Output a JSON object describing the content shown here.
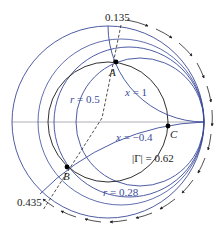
{
  "diagram": {
    "type": "smith-chart",
    "colors": {
      "blue": "#3a4a9a",
      "black": "#1a1a1a",
      "axis": "#9a9aa6"
    },
    "labels": {
      "wtg_top": "0.135",
      "wtg_bottom": "0.435",
      "point_a": "A",
      "point_b": "B",
      "point_c": "C",
      "r_half_var": "r",
      "r_half_val": " = 0.5",
      "x_one_var": "x",
      "x_one_val": " = 1",
      "x_neg_var": "x",
      "x_neg_val": " = −0.4",
      "gamma_val": "|Γ| = 0.62",
      "r_small_var": "r",
      "r_small_val": " = 0.28"
    },
    "points": [
      {
        "name": "A",
        "x": 116,
        "y": 62
      },
      {
        "name": "B",
        "x": 67,
        "y": 167
      },
      {
        "name": "C",
        "x": 168,
        "y": 126
      }
    ],
    "circles": {
      "unit": {
        "cx": 108,
        "cy": 122,
        "r": 96
      },
      "gamma": {
        "cx": 108,
        "cy": 122,
        "r": 60,
        "value": 0.62
      },
      "r_0_28": {
        "cx": 129,
        "cy": 122,
        "r": 75,
        "value": 0.28
      },
      "r_0_5": {
        "cx": 140,
        "cy": 122,
        "r": 64,
        "value": 0.5
      }
    }
  }
}
